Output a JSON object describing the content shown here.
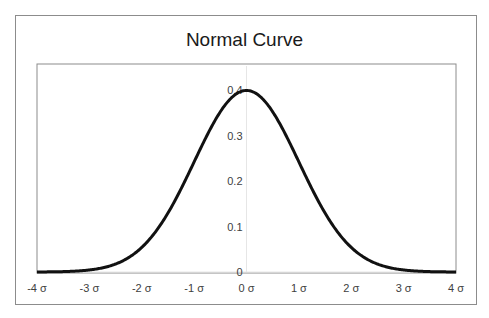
{
  "chart_data": {
    "type": "line",
    "title": "Normal Curve",
    "xlabel": "",
    "ylabel": "",
    "x_tick_labels": [
      "-4 σ",
      "-3 σ",
      "-2 σ",
      "-1 σ",
      "0 σ",
      "1 σ",
      "2 σ",
      "3 σ",
      "4 σ"
    ],
    "x_ticks": [
      -4,
      -3,
      -2,
      -1,
      0,
      1,
      2,
      3,
      4
    ],
    "y_tick_labels": [
      "0",
      "0.1",
      "0.2",
      "0.3",
      "0.4"
    ],
    "y_ticks": [
      0,
      0.1,
      0.2,
      0.3,
      0.4
    ],
    "xlim": [
      -4,
      4
    ],
    "ylim": [
      0,
      0.4
    ],
    "grid": false,
    "legend": null,
    "series": [
      {
        "name": "Normal density",
        "x": [
          -4,
          -3.5,
          -3,
          -2.5,
          -2,
          -1.5,
          -1,
          -0.5,
          0,
          0.5,
          1,
          1.5,
          2,
          2.5,
          3,
          3.5,
          4
        ],
        "values": [
          0.0001,
          0.0009,
          0.0044,
          0.0175,
          0.054,
          0.1295,
          0.242,
          0.3521,
          0.3989,
          0.3521,
          0.242,
          0.1295,
          0.054,
          0.0175,
          0.0044,
          0.0009,
          0.0001
        ]
      }
    ],
    "line_color": "#111111"
  }
}
